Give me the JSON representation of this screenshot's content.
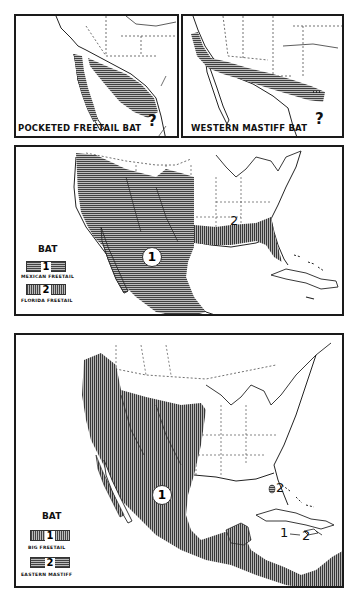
{
  "panels": {
    "pocketed": {
      "title": "POCKETED FREETAIL BAT",
      "unknown_marker": "?"
    },
    "western": {
      "title": "WESTERN MASTIFF BAT",
      "unknown_marker": "?"
    },
    "middle": {
      "legend_title": "BAT",
      "legend": [
        {
          "number": "1",
          "label": "MEXICAN FREETAIL",
          "pattern": "horizontal-hatch"
        },
        {
          "number": "2",
          "label": "FLORIDA FREETAIL",
          "pattern": "vertical-hatch"
        }
      ],
      "map_markers": [
        {
          "number": "1",
          "style": "circled"
        },
        {
          "number": "2",
          "style": "plain"
        }
      ]
    },
    "bottom": {
      "legend_title": "BAT",
      "legend": [
        {
          "number": "1",
          "label": "BIG FREETAIL",
          "pattern": "vertical-hatch"
        },
        {
          "number": "2",
          "label": "EASTERN MASTIFF",
          "pattern": "horizontal-hatch"
        }
      ],
      "map_markers": [
        {
          "number": "1",
          "style": "circled"
        },
        {
          "number": "2",
          "style": "plain",
          "location": "south-florida"
        },
        {
          "number": "1",
          "style": "plain",
          "location": "caribbean"
        },
        {
          "number": "2",
          "style": "plain",
          "location": "caribbean"
        }
      ]
    }
  },
  "colors": {
    "ink": "#1a1a1a",
    "hatch_dark": "#444444",
    "hatch_light": "#bbbbbb",
    "paper": "#ffffff"
  }
}
